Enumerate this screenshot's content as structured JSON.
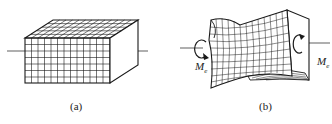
{
  "figures": [
    {
      "id": "a",
      "caption": "(a)",
      "description": "Undeformed rectangular bar with square grid on faces"
    },
    {
      "id": "b",
      "caption": "(b)",
      "description": "Twisted bar with warped cross-section under torque",
      "moment_labels": [
        {
          "symbol": "M",
          "subscript": "e",
          "side": "left"
        },
        {
          "symbol": "M",
          "subscript": "e",
          "side": "right"
        }
      ]
    }
  ],
  "colors": {
    "stroke": "#1a1a1a",
    "background": "#ffffff"
  }
}
